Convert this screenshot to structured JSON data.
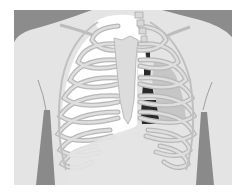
{
  "figure": {
    "colors": {
      "page_background": "#ffffff",
      "body_background": "#e4e4e4",
      "shoulder_shadow": "#8c8c8c",
      "arm_shadow": "#8a8a8a",
      "bone_fill": "#dcdcdc",
      "bone_outline": "#b4b4b4",
      "right_lung_air": "#ffffff",
      "collapsed_lung": "#c6c6c6",
      "pneumothorax_dark": "#2a2a2a",
      "diaphragm_area": "#e4e4e4"
    },
    "labels": []
  }
}
